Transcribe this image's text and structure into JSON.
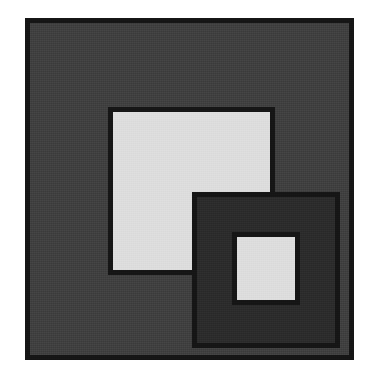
{
  "figure": {
    "title": "Nested overlapping squares",
    "canvas": {
      "width": 376,
      "height": 375,
      "background": "#ffffff"
    },
    "palette": {
      "outline": "#151515",
      "outer_fill": "#3f3f3f",
      "inner_light_fill": "#dcdcdc",
      "overlap_dark_fill": "#2b2b2b",
      "paper": "#ffffff"
    },
    "shapes": [
      {
        "id": "outer-square",
        "label": "Outer square",
        "fill": "#3f3f3f",
        "stroke": "#151515",
        "stroke_width": 5,
        "x": 25,
        "y": 18,
        "width": 329,
        "height": 342
      },
      {
        "id": "upper-light-square",
        "label": "Upper-left light square",
        "fill": "#dcdcdc",
        "stroke": "#151515",
        "stroke_width": 5,
        "x": 108,
        "y": 107,
        "width": 167,
        "height": 168
      },
      {
        "id": "lower-dark-square",
        "label": "Lower-right dark square",
        "fill": "#2b2b2b",
        "stroke": "#151515",
        "stroke_width": 5,
        "x": 192,
        "y": 192,
        "width": 148,
        "height": 156
      },
      {
        "id": "inner-light-square",
        "label": "Innermost light square",
        "fill": "#dcdcdc",
        "stroke": "#151515",
        "stroke_width": 5,
        "x": 232,
        "y": 232,
        "width": 68,
        "height": 73
      }
    ]
  }
}
